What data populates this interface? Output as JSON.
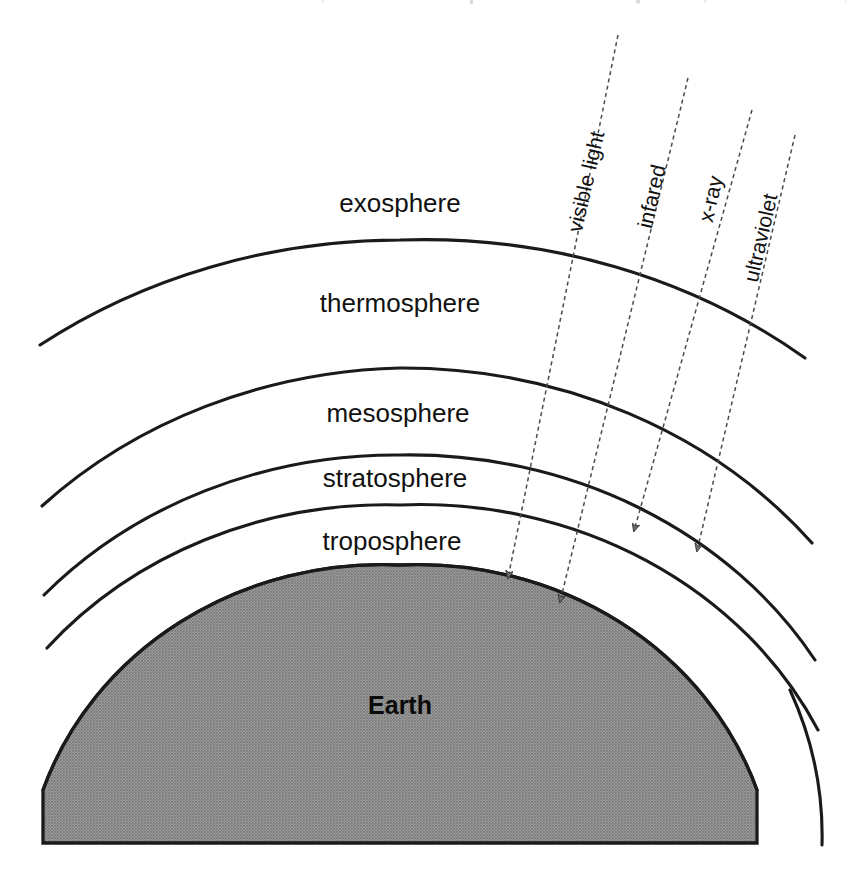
{
  "diagram": {
    "background_color": "#ffffff",
    "line_color": "#1a1a1a",
    "earth_fill_color": "#8a8a8a",
    "ray_color": "#4a4a4a",
    "arrow_fill_color": "#6d6d6d",
    "label_text_color": "#111111"
  },
  "atmosphere": {
    "layers": [
      {
        "id": "exosphere",
        "label": "exosphere",
        "order": 1,
        "label_x": 400,
        "label_y": 205,
        "outer_boundary_apex_y": null,
        "inner_boundary_apex_y": 240
      },
      {
        "id": "thermosphere",
        "label": "thermosphere",
        "order": 2,
        "label_x": 400,
        "label_y": 305,
        "outer_boundary_apex_y": 240,
        "inner_boundary_apex_y": 368
      },
      {
        "id": "mesosphere",
        "label": "mesosphere",
        "order": 3,
        "label_x": 398,
        "label_y": 415,
        "outer_boundary_apex_y": 368,
        "inner_boundary_apex_y": 455
      },
      {
        "id": "stratosphere",
        "label": "stratosphere",
        "order": 4,
        "label_x": 395,
        "label_y": 480,
        "outer_boundary_apex_y": 455,
        "inner_boundary_apex_y": 505
      },
      {
        "id": "troposphere",
        "label": "troposphere",
        "order": 5,
        "label_x": 392,
        "label_y": 543,
        "outer_boundary_apex_y": 505,
        "inner_boundary_apex_y": 565
      }
    ]
  },
  "earth": {
    "label": "Earth",
    "label_x": 400,
    "label_y": 707,
    "fill": "#8a8a8a",
    "surface_apex_y": 565
  },
  "radiation": {
    "description": "Dotted arrows representing incoming electromagnetic radiation entering the atmosphere",
    "rays": [
      {
        "id": "visible-light",
        "label": "visible light",
        "order": 1,
        "start_x": 618,
        "start_y": 35,
        "end_x": 508,
        "end_y": 578,
        "label_x": 584,
        "label_y": 188,
        "label_rotation": -76,
        "penetrates_to": "earth-surface",
        "reaches_surface": true
      },
      {
        "id": "infared",
        "label": "infared",
        "order": 2,
        "start_x": 688,
        "start_y": 78,
        "end_x": 560,
        "end_y": 602,
        "label_x": 651,
        "label_y": 200,
        "label_rotation": -76,
        "penetrates_to": "earth-surface",
        "reaches_surface": true
      },
      {
        "id": "x-ray",
        "label": "x-ray",
        "order": 3,
        "start_x": 752,
        "start_y": 110,
        "end_x": 634,
        "end_y": 531,
        "label_x": 712,
        "label_y": 200,
        "label_rotation": -76,
        "penetrates_to": "stratosphere",
        "reaches_surface": false
      },
      {
        "id": "ultraviolet",
        "label": "ultraviolet",
        "order": 4,
        "start_x": 795,
        "start_y": 135,
        "end_x": 697,
        "end_y": 551,
        "label_x": 757,
        "label_y": 232,
        "label_rotation": -76,
        "penetrates_to": "stratosphere",
        "reaches_surface": false
      }
    ]
  }
}
